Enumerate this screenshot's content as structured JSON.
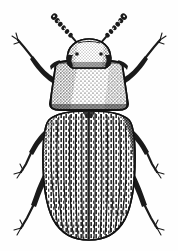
{
  "figure": {
    "subject_name": "beetle",
    "common_name": "Confused flour beetle",
    "style": "black-and-white stipple and line engraving",
    "orientation": "dorsal view, head up",
    "background_color": "#fefefe",
    "ink_color": "#1a1a1a",
    "canvas": {
      "width": 178,
      "height": 251
    }
  },
  "anatomy": {
    "head": {
      "label": "head",
      "shape": "rounded dome, stippled",
      "center_x": 89,
      "top_y": 40,
      "width": 42,
      "height": 30
    },
    "eyes": {
      "label": "compound eyes",
      "count": 2,
      "position": "lateral, at base of head"
    },
    "antennae": {
      "label": "antennae",
      "count": 2,
      "segments": 9,
      "tip": "club",
      "left_tip_x": 54,
      "left_tip_y": 16,
      "right_tip_x": 124,
      "right_tip_y": 16
    },
    "pronotum": {
      "label": "pronotum",
      "shape": "trapezoidal, densely punctate",
      "top_y": 62,
      "bottom_y": 110,
      "top_width": 66,
      "bottom_width": 84
    },
    "elytra": {
      "label": "elytra",
      "shape": "elongate oval, apex rounded",
      "top_y": 112,
      "bottom_y": 238,
      "max_width": 88,
      "stria_count": 18,
      "striae_per_elytron": 9,
      "shading": "heavy stipple along right margin"
    },
    "scutellum": {
      "label": "scutellum",
      "shape": "small triangular plate at elytral base"
    },
    "legs": {
      "label": "legs",
      "count": 6,
      "pairs": [
        {
          "name": "prothoracic-legs",
          "direction": "forward-outward"
        },
        {
          "name": "mesothoracic-legs",
          "direction": "outward-downward"
        },
        {
          "name": "metathoracic-legs",
          "direction": "backward-downward"
        }
      ],
      "tarsus_tip": "bifid claw"
    }
  },
  "strokes": {
    "left_antenna": "M 86 54 L 78 44 L 70 35 L 63 27 L 57 19",
    "right_antenna": "M 94 54 L 102 45 L 110 36 L 117 28 L 123 20",
    "left_fore_leg": "M 52 80 L 42 70 L 33 58 L 24 47 L 17 41",
    "right_fore_leg": "M 128 80 L 138 70 L 147 58 L 155 47 L 162 41",
    "left_mid_leg": "M 48 128 L 36 140 L 28 152 L 22 162 L 16 168",
    "right_mid_leg": "M 132 128 L 144 140 L 152 152 L 158 162 L 164 168",
    "left_hind_leg": "M 52 162 L 40 178 L 31 196 L 24 212 L 17 224",
    "right_hind_leg": "M 128 162 L 140 178 L 149 196 L 156 212 L 163 224"
  },
  "palette": {
    "ink": "#1a1a1a",
    "mid_ink": "#4a4a4a",
    "light_ink": "#8a8a8a",
    "paper": "#fefefe"
  },
  "labels": {
    "alt_text": "Line drawing of a small elongate beetle seen from above, with clubbed antennae, punctate pronotum and striate elytra."
  }
}
